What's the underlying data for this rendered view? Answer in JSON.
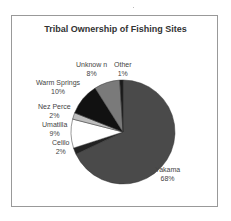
{
  "chart_data": {
    "type": "pie",
    "title": "Tribal Ownership of Fishing Sites",
    "categories": [
      "Yakama",
      "Celilo",
      "Umatilla",
      "Nez Perce",
      "Warm Springs",
      "Unknown",
      "Other"
    ],
    "values": [
      68,
      2,
      9,
      2,
      10,
      8,
      1
    ],
    "labels": [
      {
        "name": "Yakama",
        "pct": "68%"
      },
      {
        "name": "Celilo",
        "pct": "2%"
      },
      {
        "name": "Umatilla",
        "pct": "9%"
      },
      {
        "name": "Nez Perce",
        "pct": "2%"
      },
      {
        "name": "Warm Springs",
        "pct": "10%"
      },
      {
        "name": "Unknow n",
        "pct": "8%"
      },
      {
        "name": "Other",
        "pct": "1%"
      }
    ],
    "colors": [
      "#4a4a4a",
      "#222222",
      "#ffffff",
      "#bdbdbd",
      "#111111",
      "#7a7a7a",
      "#1a1a1a"
    ],
    "legend": "none (data labels)"
  }
}
